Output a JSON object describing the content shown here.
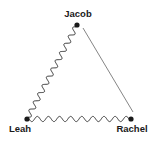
{
  "diagram": {
    "type": "relationship-triangle",
    "nodes": [
      {
        "id": "jacob",
        "label": "Jacob",
        "x": 77,
        "y": 25,
        "label_x": 78,
        "label_y": 9
      },
      {
        "id": "leah",
        "label": "Leah",
        "x": 27,
        "y": 119,
        "label_x": 20,
        "label_y": 124
      },
      {
        "id": "rachel",
        "label": "Rachel",
        "x": 131,
        "y": 119,
        "label_x": 132,
        "label_y": 124
      }
    ],
    "edges": [
      {
        "from": "jacob",
        "to": "leah",
        "style": "wavy",
        "meaning": "conflicted relationship"
      },
      {
        "from": "leah",
        "to": "rachel",
        "style": "wavy",
        "meaning": "conflicted relationship"
      },
      {
        "from": "jacob",
        "to": "rachel",
        "style": "straight",
        "meaning": "relationship"
      }
    ],
    "colors": {
      "node": "#1a1a1a",
      "wavy_line": "#333333",
      "straight_line": "#777777",
      "label": "#1a1a1a"
    }
  }
}
